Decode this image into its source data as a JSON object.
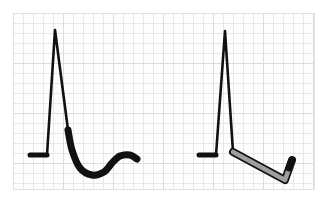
{
  "figure": {
    "width": 328,
    "height": 201,
    "background_color": "#ffffff"
  },
  "grid": {
    "label": "ecg-paper-grid",
    "x": 13,
    "y": 13,
    "width": 302,
    "height": 177,
    "paper_color": "#fdfdfd",
    "minor_line_color": "#e9e6e8",
    "major_line_color": "#dedbdd",
    "minor_spacing": 10,
    "major_spacing": 50,
    "border_color": "#e4e1e3"
  },
  "chart_data": {
    "type": "line",
    "xlabel": "",
    "ylabel": "",
    "grid": true,
    "legend_position": "none",
    "xlim": [
      13,
      315
    ],
    "ylim": [
      13,
      190
    ],
    "series": [
      {
        "name": "concave-upsloping-st-segment",
        "stroke_color": "#111111",
        "fill_color": "#111111",
        "line_width": 5,
        "baseline_y": 155,
        "r_peak": {
          "x": 55,
          "y": 30
        },
        "points": [
          [
            30,
            155
          ],
          [
            47,
            155
          ],
          [
            55,
            30
          ],
          [
            68,
            130
          ],
          [
            72,
            150
          ],
          [
            80,
            168
          ],
          [
            92,
            175
          ],
          [
            104,
            172
          ],
          [
            112,
            163
          ],
          [
            120,
            156
          ],
          [
            130,
            155
          ],
          [
            137,
            159
          ]
        ]
      },
      {
        "name": "downsloping-st-depression-highlighted",
        "stroke_color": "#111111",
        "fill_color": "#111111",
        "line_width": 5,
        "baseline_y": 155,
        "r_peak": {
          "x": 225,
          "y": 31
        },
        "points": [
          [
            199,
            155
          ],
          [
            216,
            155
          ],
          [
            225,
            31
          ],
          [
            233,
            152
          ],
          [
            285,
            180
          ],
          [
            292,
            160
          ]
        ],
        "highlight": {
          "name": "st-depression-highlight",
          "color": "#9e9e9e",
          "from": [
            233,
            152
          ],
          "to": [
            285,
            180
          ],
          "hook_to": [
            292,
            160
          ]
        }
      }
    ]
  },
  "annotations": []
}
